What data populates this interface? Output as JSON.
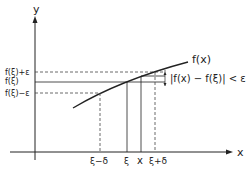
{
  "axes": {
    "y_label": "y",
    "x_label": "x"
  },
  "y_ticks": {
    "upper": "f(ξ)+ε",
    "mid": "f(ξ)",
    "lower": "f(ξ)−ε"
  },
  "x_ticks": {
    "left_delta": "ξ−δ",
    "xi": "ξ",
    "x": "x",
    "right_delta": "ξ+δ"
  },
  "curve_label": "f(x)",
  "inequality": "|f(x) − f(ξ)| < ε",
  "colors": {
    "line": "#222222",
    "dash": "#444444"
  }
}
